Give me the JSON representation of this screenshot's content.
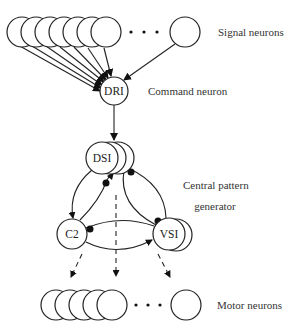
{
  "diagram": {
    "labels": {
      "signal_neurons": "Signal neurons",
      "command_neuron": "Command neuron",
      "cpg_line1": "Central pattern",
      "cpg_line2": "generator",
      "motor_neurons": "Motor neurons"
    },
    "nodes": {
      "dri": "DRI",
      "dsi": "DSI",
      "c2": "C2",
      "vsi": "VSI"
    },
    "ellipsis": "· · ·",
    "colors": {
      "stroke": "#222222",
      "background": "#ffffff",
      "text": "#333333"
    }
  }
}
